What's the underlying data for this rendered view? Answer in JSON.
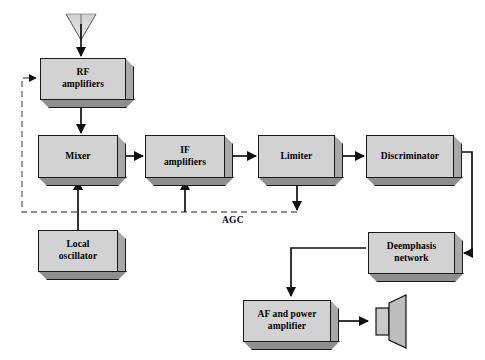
{
  "diagram": {
    "blocks": [
      {
        "id": "rf",
        "label": "RF\namplifiers",
        "x": 40,
        "y": 58,
        "w": 86,
        "h": 42
      },
      {
        "id": "mixer",
        "label": "Mixer",
        "x": 38,
        "y": 135,
        "w": 80,
        "h": 43
      },
      {
        "id": "if",
        "label": "IF\namplifiers",
        "x": 145,
        "y": 135,
        "w": 80,
        "h": 43
      },
      {
        "id": "lim",
        "label": "Limiter",
        "x": 258,
        "y": 135,
        "w": 77,
        "h": 43
      },
      {
        "id": "disc",
        "label": "Discriminator",
        "x": 366,
        "y": 135,
        "w": 88,
        "h": 43
      },
      {
        "id": "lo",
        "label": "Local\noscillator",
        "x": 38,
        "y": 230,
        "w": 80,
        "h": 42
      },
      {
        "id": "deem",
        "label": "Deemphasis\nnetwork",
        "x": 368,
        "y": 232,
        "w": 87,
        "h": 42
      },
      {
        "id": "af",
        "label": "AF and power\namplifier",
        "x": 243,
        "y": 300,
        "w": 88,
        "h": 42
      }
    ],
    "agc_label": "AGC",
    "icons": {
      "antenna": "antenna-icon",
      "speaker": "speaker-icon"
    },
    "colors": {
      "block_face": "#d2d2d2",
      "block_side": "#a8a8a8",
      "block_bottom": "#8f8f8f",
      "stroke": "#1a1a1a",
      "dashed_feedback": "#6b6b6b",
      "background": "#ffffff"
    }
  }
}
